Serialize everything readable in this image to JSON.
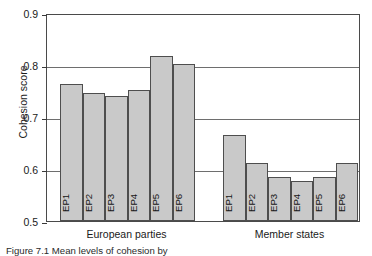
{
  "chart_data": {
    "type": "bar",
    "title": "",
    "xlabel": "",
    "ylabel": "Cohesion score",
    "ylim": [
      0.5,
      0.9
    ],
    "yticks": [
      "0.5",
      "0.6",
      "0.7",
      "0.8",
      "0.9"
    ],
    "ytick_values": [
      0.5,
      0.6,
      0.7,
      0.8,
      0.9
    ],
    "grid": true,
    "legend": "none",
    "categories": [
      "EP1",
      "EP2",
      "EP3",
      "EP4",
      "EP5",
      "EP6"
    ],
    "groups": [
      {
        "name": "European parties",
        "categories": [
          "EP1",
          "EP2",
          "EP3",
          "EP4",
          "EP5",
          "EP6"
        ],
        "values": [
          0.763,
          0.747,
          0.74,
          0.751,
          0.817,
          0.801
        ]
      },
      {
        "name": "Member states",
        "categories": [
          "EP1",
          "EP2",
          "EP3",
          "EP4",
          "EP5",
          "EP6"
        ],
        "values": [
          0.665,
          0.612,
          0.585,
          0.577,
          0.585,
          0.612
        ]
      }
    ],
    "colors": {
      "bar_fill": "#c9c9c9",
      "bar_stroke": "#4e4e4e",
      "axis": "#4a4a4a",
      "grid": "#6e6e6e",
      "text": "#1a1a1a",
      "background": "#ffffff"
    }
  },
  "axis": {
    "y_title": "Cohesion score"
  },
  "caption": {
    "text": "Figure 7.1   Mean levels of cohesion by"
  }
}
